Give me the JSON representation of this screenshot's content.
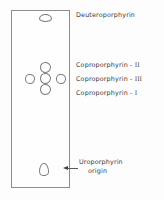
{
  "figure": {
    "type": "chromatogram-diagram",
    "background_color": "#fdfdfd",
    "line_color": "#8d8d8d",
    "text_color": "#3a3a3a"
  },
  "plate": {
    "name": "chromatography-plate",
    "outline_color": "#8d8d8d"
  },
  "spots": [
    {
      "id": "deuteroporphyrin-spot",
      "shape": "flat-oval",
      "left": 26.5,
      "top": 2.8,
      "width": 13,
      "height": 8
    },
    {
      "id": "copro-ii-spot",
      "shape": "round-blob",
      "left": 28,
      "top": 51,
      "width": 11,
      "height": 11
    },
    {
      "id": "copro-iii-spot",
      "shape": "round-blob",
      "left": 28,
      "top": 62,
      "width": 11,
      "height": 11
    },
    {
      "id": "copro-i-spot",
      "shape": "round-blob",
      "left": 28,
      "top": 73,
      "width": 11,
      "height": 11
    },
    {
      "id": "copro-left-spot",
      "shape": "round-blob",
      "left": 13,
      "top": 62.5,
      "width": 10,
      "height": 10.5
    },
    {
      "id": "copro-right-spot",
      "shape": "round-blob",
      "left": 44,
      "top": 62.5,
      "width": 9.5,
      "height": 10.5
    },
    {
      "id": "uroporphyrin-origin-spot",
      "shape": "teardrop",
      "left": 27,
      "top": 152,
      "width": 10,
      "height": 13
    }
  ],
  "labels": {
    "deuteroporphyrin": {
      "text": "Deuteroporphyrin",
      "top": 11
    },
    "coproporphyrin_ii": {
      "prefix": "Coproporphyrin - ",
      "numeral": "II",
      "top": 61
    },
    "coproporphyrin_iii": {
      "prefix": "Coproporphyrin - ",
      "numeral": "III",
      "top": 75
    },
    "coproporphyrin_i": {
      "prefix": "Coproporphyrin - ",
      "numeral": "I",
      "top": 89
    },
    "uroporphyrin_origin": {
      "line1": "Uroporphyrin",
      "line2": "origin",
      "top": 158
    }
  },
  "arrow": {
    "name": "origin-arrow",
    "direction": "left",
    "color": "#3f3f3f"
  }
}
